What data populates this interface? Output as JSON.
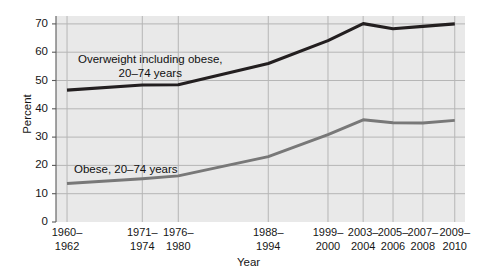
{
  "figure": {
    "clipped_header_text": "",
    "axis_title_x": "Year",
    "axis_title_y": "Percent",
    "series_labels": {
      "overweight_line1": "Overweight including obese,",
      "overweight_line2": "20–74 years",
      "obese": "Obese, 20–74 years"
    },
    "colors": {
      "overweight_line": "#231f20",
      "obese_line": "#787878",
      "plot_background": "#e9e9e9",
      "gridline": "#b6b6b6",
      "axis": "#5a5a5a",
      "text": "#161616"
    }
  },
  "chart_data": {
    "type": "line",
    "title": "",
    "subtitle": "",
    "xlabel": "Year",
    "ylabel": "Percent",
    "ylim": [
      0,
      75
    ],
    "yticks": [
      0,
      10,
      20,
      30,
      40,
      50,
      60,
      70
    ],
    "ytick_labels": [
      "0",
      "10",
      "20",
      "30",
      "40",
      "50",
      "60",
      "70"
    ],
    "grid": true,
    "legend_position": "inline-annotations",
    "categories": [
      "1960–1962",
      "1971–1974",
      "1976–1980",
      "1988–1994",
      "1999–2000",
      "2003–2004",
      "2005–2006",
      "2007–2008",
      "2009–2010"
    ],
    "category_labels_wrapped": [
      [
        "1960–",
        "1962"
      ],
      [
        "1971–",
        "1974"
      ],
      [
        "1976–",
        "1980"
      ],
      [
        "1988–",
        "1994"
      ],
      [
        "1999–",
        "2000"
      ],
      [
        "2003–",
        "2004"
      ],
      [
        "2005–",
        "2006"
      ],
      [
        "2007–",
        "2008"
      ],
      [
        "2009–",
        "2010"
      ]
    ],
    "x_positions_fraction": [
      0.027,
      0.211,
      0.299,
      0.519,
      0.665,
      0.751,
      0.824,
      0.897,
      0.975
    ],
    "series": [
      {
        "name": "Overweight including obese, 20–74 years",
        "color": "#231f20",
        "values": [
          46.6,
          48.4,
          48.5,
          56.0,
          64.1,
          70.1,
          68.3,
          69.1,
          70.0
        ]
      },
      {
        "name": "Obese, 20–74 years",
        "color": "#787878",
        "values": [
          13.6,
          15.3,
          16.3,
          23.1,
          30.9,
          36.1,
          35.1,
          35.0,
          35.9
        ]
      }
    ],
    "annotations": [
      {
        "text": "Overweight including obese, 20–74 years",
        "series": "Overweight including obese, 20–74 years"
      },
      {
        "text": "Obese, 20–74 years",
        "series": "Obese, 20–74 years"
      }
    ]
  }
}
